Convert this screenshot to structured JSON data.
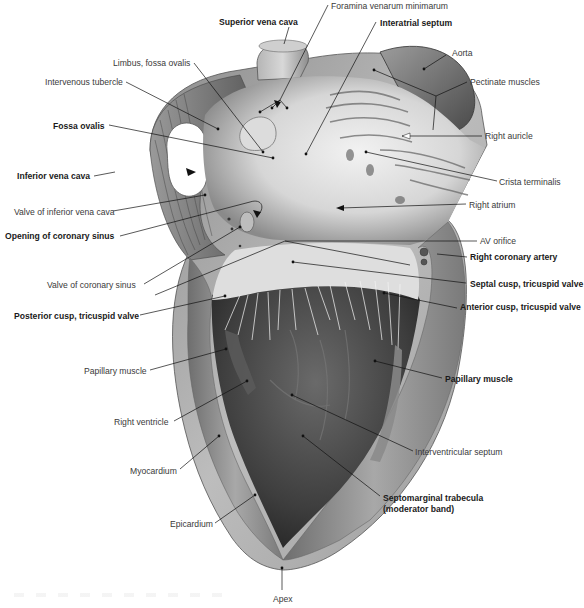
{
  "figure": {
    "labels": [
      {
        "id": "superior-vena-cava",
        "text": "Superior vena cava",
        "bold": true,
        "x": 219,
        "y": 17
      },
      {
        "id": "foramina-venarum-minimarum",
        "text": "Foramina venarum minimarum",
        "bold": false,
        "x": 331,
        "y": 1
      },
      {
        "id": "interatrial-septum",
        "text": "Interatrial septum",
        "bold": true,
        "x": 380,
        "y": 18
      },
      {
        "id": "limbus-fossa-ovalis",
        "text": "Limbus, fossa ovalis",
        "bold": false,
        "x": 113,
        "y": 58
      },
      {
        "id": "intervenous-tubercle",
        "text": "Intervenous tubercle",
        "bold": false,
        "x": 45,
        "y": 77
      },
      {
        "id": "aorta",
        "text": "Aorta",
        "bold": false,
        "x": 452,
        "y": 48
      },
      {
        "id": "pectinate-muscles",
        "text": "Pectinate muscles",
        "bold": false,
        "x": 470,
        "y": 77
      },
      {
        "id": "fossa-ovalis",
        "text": "Fossa ovalis",
        "bold": true,
        "x": 53,
        "y": 121
      },
      {
        "id": "right-auricle",
        "text": "Right auricle",
        "bold": false,
        "x": 485,
        "y": 131
      },
      {
        "id": "inferior-vena-cava",
        "text": "Inferior vena cava",
        "bold": true,
        "x": 17,
        "y": 171
      },
      {
        "id": "crista-terminalis",
        "text": "Crista terminalis",
        "bold": false,
        "x": 499,
        "y": 177
      },
      {
        "id": "valve-of-inferior-vena-cava",
        "text": "Valve of inferior vena cava",
        "bold": false,
        "x": 14,
        "y": 207
      },
      {
        "id": "right-atrium",
        "text": "Right atrium",
        "bold": false,
        "x": 469,
        "y": 200
      },
      {
        "id": "opening-of-coronary-sinus",
        "text": "Opening of coronary sinus",
        "bold": true,
        "x": 5,
        "y": 231
      },
      {
        "id": "av-orifice",
        "text": "AV orifice",
        "bold": false,
        "x": 480,
        "y": 236
      },
      {
        "id": "right-coronary-artery",
        "text": "Right coronary artery",
        "bold": true,
        "x": 470,
        "y": 252
      },
      {
        "id": "valve-of-coronary-sinus",
        "text": "Valve of coronary sinus",
        "bold": false,
        "x": 47,
        "y": 280
      },
      {
        "id": "septal-cusp-tricuspid-valve",
        "text": "Septal cusp, tricuspid valve",
        "bold": true,
        "x": 470,
        "y": 279
      },
      {
        "id": "anterior-cusp-tricuspid-valve",
        "text": "Anterior cusp, tricuspid valve",
        "bold": true,
        "x": 460,
        "y": 302
      },
      {
        "id": "posterior-cusp-tricuspid-valve",
        "text": "Posterior cusp, tricuspid valve",
        "bold": true,
        "x": 14,
        "y": 311
      },
      {
        "id": "papillary-muscle-left",
        "text": "Papillary muscle",
        "bold": false,
        "x": 84,
        "y": 366
      },
      {
        "id": "papillary-muscle-right",
        "text": "Papillary muscle",
        "bold": true,
        "x": 445,
        "y": 374
      },
      {
        "id": "right-ventricle",
        "text": "Right ventricle",
        "bold": false,
        "x": 114,
        "y": 417
      },
      {
        "id": "interventricular-septum",
        "text": "Interventricular septum",
        "bold": false,
        "x": 415,
        "y": 447
      },
      {
        "id": "myocardium",
        "text": "Myocardium",
        "bold": false,
        "x": 130,
        "y": 466
      },
      {
        "id": "septomarginal-trabecula",
        "text": "Septomarginal trabecula",
        "bold": true,
        "x": 383,
        "y": 493
      },
      {
        "id": "moderator-band",
        "text": "(moderator band)",
        "bold": true,
        "x": 383,
        "y": 504
      },
      {
        "id": "epicardium",
        "text": "Epicardium",
        "bold": false,
        "x": 170,
        "y": 519
      },
      {
        "id": "apex",
        "text": "Apex",
        "bold": false,
        "x": 273,
        "y": 594
      }
    ],
    "colors": {
      "background": "#ffffff",
      "label_regular": "#3a3a3a",
      "label_bold": "#1a1a1a",
      "leader_line": "#111111",
      "tissue_light": "#e6e6e6",
      "tissue_mid": "#9a9a9a",
      "tissue_dark": "#3e3e3e"
    }
  }
}
